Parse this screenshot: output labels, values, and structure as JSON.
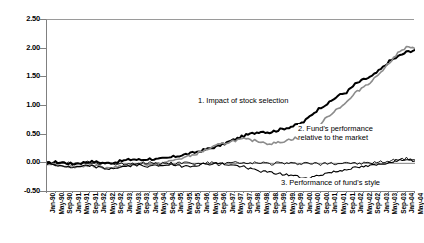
{
  "chart_data": {
    "type": "line",
    "title": "",
    "xlabel": "",
    "ylabel": "",
    "ylim": [
      -0.5,
      2.5
    ],
    "yticks": [
      "2.50",
      "2.00",
      "1.50",
      "1.00",
      "0.50",
      "0.00",
      "-0.50"
    ],
    "ytick_values": [
      2.5,
      2.0,
      1.5,
      1.0,
      0.5,
      0.0,
      -0.5
    ],
    "grid": false,
    "legend_position": "inline-annotations",
    "x": [
      "Jan-90",
      "May-90",
      "Sep-90",
      "Jan-91",
      "May-91",
      "Sep-91",
      "Jan-92",
      "May-92",
      "Sep-92",
      "Jan-93",
      "May-93",
      "Sep-93",
      "Jan-94",
      "May-94",
      "Sep-94",
      "Jan-95",
      "May-95",
      "Sep-95",
      "Jan-96",
      "May-96",
      "Sep-96",
      "Jan-97",
      "May-97",
      "Sep-97",
      "Jan-98",
      "May-98",
      "Sep-98",
      "Jan-99",
      "May-99",
      "Sep-99",
      "Jan-00",
      "May-00",
      "Sep-00",
      "Jan-01",
      "May-01",
      "Sep-01",
      "Jan-02",
      "May-02",
      "Sep-02",
      "Jan-03",
      "May-03",
      "Sep-03",
      "Jan-04",
      "May-04"
    ],
    "annotations": [
      {
        "id": "1",
        "text": "1. Impact of stock selection"
      },
      {
        "id": "2",
        "line1": "2. Fund's performance",
        "line2": "relative to the market"
      },
      {
        "id": "3",
        "text": "3. Performance of fund's style"
      }
    ],
    "series": [
      {
        "name": "1. Impact of stock selection",
        "color": "#000000",
        "width": 2.0,
        "values": [
          0.0,
          0.02,
          0.01,
          -0.01,
          0.01,
          0.03,
          0.02,
          0.0,
          0.02,
          0.05,
          0.07,
          0.06,
          0.08,
          0.07,
          0.09,
          0.12,
          0.15,
          0.18,
          0.22,
          0.26,
          0.3,
          0.36,
          0.42,
          0.48,
          0.52,
          0.56,
          0.54,
          0.58,
          0.62,
          0.66,
          0.72,
          0.86,
          0.98,
          1.06,
          1.18,
          1.24,
          1.38,
          1.46,
          1.52,
          1.64,
          1.78,
          1.86,
          1.94,
          1.98
        ]
      },
      {
        "name": "2. Fund's performance relative to the market",
        "color": "#8c8c8c",
        "width": 1.6,
        "values": [
          0.0,
          -0.02,
          -0.04,
          -0.06,
          -0.05,
          -0.03,
          -0.05,
          -0.08,
          -0.06,
          -0.04,
          -0.02,
          0.0,
          -0.02,
          -0.01,
          0.02,
          0.06,
          0.1,
          0.14,
          0.2,
          0.26,
          0.32,
          0.36,
          0.4,
          0.42,
          0.4,
          0.38,
          0.34,
          0.36,
          0.4,
          0.44,
          0.4,
          0.52,
          0.7,
          0.84,
          0.96,
          1.06,
          1.22,
          1.34,
          1.44,
          1.6,
          1.76,
          1.92,
          2.02,
          2.0
        ]
      },
      {
        "name": "3. Performance of fund's style",
        "color": "#000000",
        "width": 0.9,
        "values": [
          0.0,
          -0.01,
          0.01,
          -0.02,
          0.0,
          0.02,
          -0.01,
          0.01,
          0.0,
          -0.02,
          0.01,
          0.0,
          0.02,
          -0.01,
          0.01,
          0.0,
          0.02,
          -0.01,
          0.0,
          0.01,
          -0.02,
          0.0,
          0.01,
          -0.01,
          0.0,
          0.02,
          -0.01,
          0.01,
          0.0,
          -0.01,
          0.01,
          0.0,
          -0.02,
          0.01,
          0.0,
          0.02,
          -0.01,
          0.0,
          0.01,
          0.02,
          0.04,
          0.06,
          0.08,
          0.06
        ]
      },
      {
        "name": "3. Performance of fund's style (lower band)",
        "color": "#000000",
        "width": 1.1,
        "values": [
          0.0,
          -0.03,
          -0.05,
          -0.08,
          -0.06,
          -0.04,
          -0.07,
          -0.1,
          -0.08,
          -0.06,
          -0.04,
          -0.03,
          -0.05,
          -0.04,
          -0.02,
          -0.04,
          -0.05,
          -0.04,
          -0.02,
          -0.01,
          0.0,
          -0.02,
          -0.04,
          -0.06,
          -0.1,
          -0.14,
          -0.16,
          -0.18,
          -0.2,
          -0.22,
          -0.26,
          -0.24,
          -0.2,
          -0.16,
          -0.14,
          -0.1,
          -0.08,
          -0.06,
          -0.04,
          -0.02,
          0.02,
          0.06,
          0.08,
          0.04
        ]
      }
    ]
  }
}
